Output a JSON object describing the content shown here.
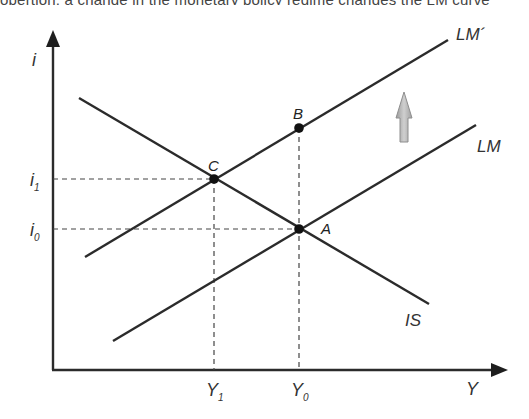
{
  "top_fragment": "opertion, a change in the monetary policy regime changes the LM curve",
  "diagram": {
    "y_axis": {
      "label": "i"
    },
    "x_axis": {
      "label": "Y"
    },
    "curves": {
      "is": {
        "label": "IS"
      },
      "lm": {
        "label": "LM"
      },
      "lm_prime": {
        "label": "LM´"
      }
    },
    "points": {
      "a": {
        "label": "A"
      },
      "b": {
        "label": "B"
      },
      "c": {
        "label": "C"
      }
    },
    "ticks": {
      "i1": {
        "base": "i",
        "sub": "1"
      },
      "i0": {
        "base": "i",
        "sub": "0"
      },
      "y1": {
        "base": "Y",
        "sub": "1"
      },
      "y0": {
        "base": "Y",
        "sub": "0"
      }
    },
    "shift_arrow": {
      "direction": "up",
      "color": "#b8b8b8"
    },
    "colors": {
      "line": "#2b2b2b",
      "text": "#333333"
    }
  }
}
